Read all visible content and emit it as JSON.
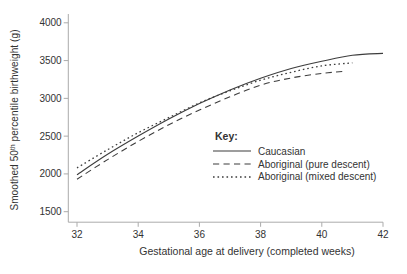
{
  "figure": {
    "background": "#ffffff",
    "text_color": "#333333",
    "axis_color": "#ababab",
    "series_color": "#3d3d3d"
  },
  "chart_data": {
    "type": "line",
    "title": "",
    "xlabel": "Gestational age at delivery (completed weeks)",
    "ylabel": "Smoothed 50th percentile birthweight (g)",
    "ylabel_parts": {
      "pre": "Smoothed 50",
      "sup": "th",
      "post": " percentile birthweight (g)"
    },
    "xlim": [
      32,
      42
    ],
    "ylim": [
      1500,
      4000
    ],
    "x_ticks": [
      32,
      34,
      36,
      38,
      40,
      42
    ],
    "y_ticks": [
      1500,
      2000,
      2500,
      3000,
      3500,
      4000
    ],
    "grid": false,
    "legend": {
      "title": "Key:",
      "position": "inside-lower-right"
    },
    "series": [
      {
        "name": "Caucasian",
        "style": "solid",
        "points": [
          [
            32,
            1990
          ],
          [
            33,
            2260
          ],
          [
            34,
            2500
          ],
          [
            35,
            2725
          ],
          [
            36,
            2930
          ],
          [
            37,
            3110
          ],
          [
            38,
            3265
          ],
          [
            39,
            3395
          ],
          [
            40,
            3490
          ],
          [
            41,
            3570
          ],
          [
            42,
            3595
          ]
        ]
      },
      {
        "name": "Aboriginal (pure descent)",
        "style": "dashed",
        "points": [
          [
            32,
            1930
          ],
          [
            33,
            2190
          ],
          [
            34,
            2430
          ],
          [
            35,
            2650
          ],
          [
            36,
            2845
          ],
          [
            37,
            3020
          ],
          [
            38,
            3175
          ],
          [
            39,
            3270
          ],
          [
            40,
            3330
          ],
          [
            40.8,
            3360
          ]
        ]
      },
      {
        "name": "Aboriginal (mixed descent)",
        "style": "dotted",
        "points": [
          [
            32,
            2080
          ],
          [
            33,
            2320
          ],
          [
            34,
            2545
          ],
          [
            35,
            2745
          ],
          [
            36,
            2940
          ],
          [
            37,
            3100
          ],
          [
            38,
            3240
          ],
          [
            39,
            3345
          ],
          [
            40,
            3430
          ],
          [
            41,
            3470
          ]
        ]
      }
    ]
  }
}
